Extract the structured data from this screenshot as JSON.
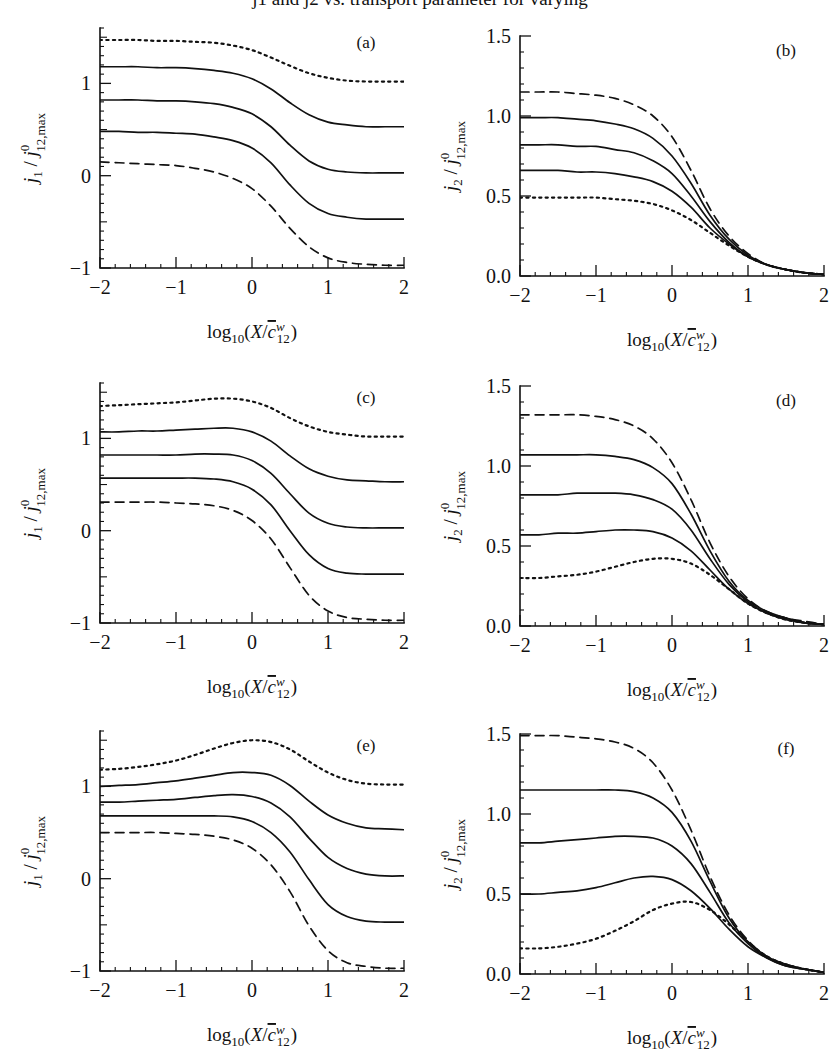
{
  "figure": {
    "background": "#ffffff",
    "ink": "#111111",
    "cropped_header": "j1 and j2 vs. transport parameter for varying",
    "panel_order": [
      "a",
      "b",
      "c",
      "d",
      "e",
      "f"
    ]
  },
  "axis_labels": {
    "x": {
      "parts": {
        "log": "log",
        "logsub": "10",
        "open": "(",
        "X": "X",
        "slash": "/",
        "c": "c",
        "csup": "w",
        "csub": "12",
        "close": ")"
      },
      "plain": "log10(X/c̄w12)"
    },
    "y1": {
      "parts": {
        "j": "j",
        "jsub": "1",
        "slash": "/",
        "j2": "j",
        "j2sup": "0",
        "j2sub": "12,max"
      },
      "plain": "j1 / j012,max"
    },
    "y2": {
      "parts": {
        "j": "j",
        "jsub": "2",
        "slash": "/",
        "j2": "j",
        "j2sup": "0",
        "j2sub": "12,max"
      },
      "plain": "j2 / j012,max"
    }
  },
  "chart_data": [
    {
      "id": "a",
      "type": "line",
      "title": "(a)",
      "xlabel": "log10(X/c̄w12)",
      "ylabel": "j1 / j012,max",
      "xlim": [
        -2,
        2
      ],
      "ylim": [
        -1,
        1.6
      ],
      "grid": false,
      "legend": "none",
      "xticks": [
        -2,
        -1,
        0,
        1,
        2
      ],
      "xticklabels": [
        "-2",
        "-1",
        "0",
        "1",
        "2"
      ],
      "yticks": [
        -1,
        0,
        1
      ],
      "yticklabels": [
        "-1",
        "0",
        "1"
      ],
      "y_minor_step": 0.1,
      "x_minor_step": 0.2,
      "x": [
        -2,
        -1.75,
        -1.5,
        -1.25,
        -1,
        -0.75,
        -0.5,
        -0.25,
        0,
        0.25,
        0.5,
        0.75,
        1,
        1.25,
        1.5,
        1.75,
        2
      ],
      "series": [
        {
          "name": "dotted-top",
          "style": "dotted",
          "values": [
            1.47,
            1.47,
            1.47,
            1.46,
            1.46,
            1.45,
            1.44,
            1.41,
            1.36,
            1.28,
            1.19,
            1.11,
            1.06,
            1.03,
            1.02,
            1.02,
            1.02
          ]
        },
        {
          "name": "solid-1",
          "style": "solid",
          "values": [
            1.18,
            1.18,
            1.18,
            1.17,
            1.17,
            1.16,
            1.14,
            1.11,
            1.05,
            0.94,
            0.79,
            0.66,
            0.58,
            0.55,
            0.53,
            0.53,
            0.53
          ]
        },
        {
          "name": "solid-2",
          "style": "solid",
          "values": [
            0.82,
            0.82,
            0.82,
            0.81,
            0.81,
            0.8,
            0.78,
            0.74,
            0.67,
            0.53,
            0.33,
            0.16,
            0.07,
            0.04,
            0.03,
            0.03,
            0.03
          ]
        },
        {
          "name": "solid-3",
          "style": "solid",
          "values": [
            0.48,
            0.48,
            0.47,
            0.47,
            0.46,
            0.45,
            0.42,
            0.38,
            0.3,
            0.14,
            -0.1,
            -0.3,
            -0.41,
            -0.45,
            -0.47,
            -0.47,
            -0.47
          ]
        },
        {
          "name": "dashed-bottom",
          "style": "dashed",
          "values": [
            0.15,
            0.14,
            0.13,
            0.12,
            0.11,
            0.08,
            0.04,
            -0.03,
            -0.14,
            -0.33,
            -0.57,
            -0.77,
            -0.89,
            -0.94,
            -0.96,
            -0.97,
            -0.97
          ]
        }
      ]
    },
    {
      "id": "b",
      "type": "line",
      "title": "(b)",
      "xlabel": "log10(X/c̄w12)",
      "ylabel": "j2 / j012,max",
      "xlim": [
        -2,
        2
      ],
      "ylim": [
        0,
        1.5
      ],
      "grid": false,
      "legend": "none",
      "xticks": [
        -2,
        -1,
        0,
        1,
        2
      ],
      "xticklabels": [
        "-2",
        "-1",
        "0",
        "1",
        "2"
      ],
      "yticks": [
        0,
        0.5,
        1.0,
        1.5
      ],
      "yticklabels": [
        "0.0",
        "0.5",
        "1.0",
        "1.5"
      ],
      "y_minor_step": 0.1,
      "x_minor_step": 0.2,
      "x": [
        -2,
        -1.75,
        -1.5,
        -1.25,
        -1,
        -0.75,
        -0.5,
        -0.25,
        0,
        0.25,
        0.5,
        0.75,
        1,
        1.25,
        1.5,
        1.75,
        2
      ],
      "series": [
        {
          "name": "dashed-top",
          "style": "dashed",
          "values": [
            1.15,
            1.15,
            1.15,
            1.14,
            1.13,
            1.11,
            1.07,
            1.0,
            0.87,
            0.66,
            0.42,
            0.25,
            0.14,
            0.07,
            0.04,
            0.02,
            0.01
          ]
        },
        {
          "name": "solid-1",
          "style": "solid",
          "values": [
            0.99,
            0.99,
            0.99,
            0.98,
            0.97,
            0.95,
            0.92,
            0.86,
            0.75,
            0.58,
            0.38,
            0.23,
            0.13,
            0.07,
            0.04,
            0.02,
            0.01
          ]
        },
        {
          "name": "solid-2",
          "style": "solid",
          "values": [
            0.82,
            0.82,
            0.82,
            0.81,
            0.81,
            0.79,
            0.77,
            0.72,
            0.64,
            0.5,
            0.34,
            0.21,
            0.12,
            0.07,
            0.04,
            0.02,
            0.01
          ]
        },
        {
          "name": "solid-3",
          "style": "solid",
          "values": [
            0.66,
            0.66,
            0.66,
            0.65,
            0.65,
            0.64,
            0.62,
            0.59,
            0.53,
            0.43,
            0.3,
            0.2,
            0.12,
            0.07,
            0.04,
            0.02,
            0.01
          ]
        },
        {
          "name": "dotted-bottom",
          "style": "dotted",
          "values": [
            0.49,
            0.49,
            0.49,
            0.49,
            0.49,
            0.48,
            0.47,
            0.45,
            0.41,
            0.35,
            0.27,
            0.19,
            0.12,
            0.07,
            0.04,
            0.02,
            0.01
          ]
        }
      ]
    },
    {
      "id": "c",
      "type": "line",
      "title": "(c)",
      "xlabel": "log10(X/c̄w12)",
      "ylabel": "j1 / j012,max",
      "xlim": [
        -2,
        2
      ],
      "ylim": [
        -1,
        1.6
      ],
      "grid": false,
      "legend": "none",
      "xticks": [
        -2,
        -1,
        0,
        1,
        2
      ],
      "xticklabels": [
        "-2",
        "-1",
        "0",
        "1",
        "2"
      ],
      "yticks": [
        -1,
        0,
        1
      ],
      "yticklabels": [
        "-1",
        "0",
        "1"
      ],
      "y_minor_step": 0.1,
      "x_minor_step": 0.2,
      "x": [
        -2,
        -1.75,
        -1.5,
        -1.25,
        -1,
        -0.75,
        -0.5,
        -0.25,
        0,
        0.25,
        0.5,
        0.75,
        1,
        1.25,
        1.5,
        1.75,
        2
      ],
      "series": [
        {
          "name": "dotted-top",
          "style": "dotted",
          "values": [
            1.35,
            1.36,
            1.37,
            1.38,
            1.39,
            1.41,
            1.43,
            1.43,
            1.4,
            1.33,
            1.22,
            1.13,
            1.07,
            1.04,
            1.02,
            1.02,
            1.02
          ]
        },
        {
          "name": "solid-1",
          "style": "solid",
          "values": [
            1.07,
            1.07,
            1.08,
            1.08,
            1.09,
            1.1,
            1.11,
            1.11,
            1.07,
            0.97,
            0.81,
            0.67,
            0.59,
            0.55,
            0.54,
            0.53,
            0.53
          ]
        },
        {
          "name": "solid-2",
          "style": "solid",
          "values": [
            0.82,
            0.82,
            0.82,
            0.82,
            0.82,
            0.83,
            0.83,
            0.82,
            0.76,
            0.62,
            0.4,
            0.19,
            0.08,
            0.04,
            0.03,
            0.03,
            0.03
          ]
        },
        {
          "name": "solid-3",
          "style": "solid",
          "values": [
            0.57,
            0.57,
            0.57,
            0.57,
            0.57,
            0.57,
            0.56,
            0.53,
            0.45,
            0.28,
            0.0,
            -0.26,
            -0.41,
            -0.46,
            -0.47,
            -0.47,
            -0.47
          ]
        },
        {
          "name": "dashed-bottom",
          "style": "dashed",
          "values": [
            0.31,
            0.31,
            0.31,
            0.31,
            0.3,
            0.29,
            0.27,
            0.22,
            0.11,
            -0.09,
            -0.4,
            -0.7,
            -0.87,
            -0.94,
            -0.96,
            -0.97,
            -0.97
          ]
        }
      ]
    },
    {
      "id": "d",
      "type": "line",
      "title": "(d)",
      "xlabel": "log10(X/c̄w12)",
      "ylabel": "j2 / j012,max",
      "xlim": [
        -2,
        2
      ],
      "ylim": [
        0,
        1.5
      ],
      "grid": false,
      "legend": "none",
      "xticks": [
        -2,
        -1,
        0,
        1,
        2
      ],
      "xticklabels": [
        "-2",
        "-1",
        "0",
        "1",
        "2"
      ],
      "yticks": [
        0,
        0.5,
        1.0,
        1.5
      ],
      "yticklabels": [
        "0.0",
        "0.5",
        "1.0",
        "1.5"
      ],
      "y_minor_step": 0.1,
      "x_minor_step": 0.2,
      "x": [
        -2,
        -1.75,
        -1.5,
        -1.25,
        -1,
        -0.75,
        -0.5,
        -0.25,
        0,
        0.25,
        0.5,
        0.75,
        1,
        1.25,
        1.5,
        1.75,
        2
      ],
      "series": [
        {
          "name": "dashed-top",
          "style": "dashed",
          "values": [
            1.32,
            1.32,
            1.32,
            1.32,
            1.31,
            1.29,
            1.25,
            1.17,
            1.02,
            0.79,
            0.52,
            0.31,
            0.17,
            0.09,
            0.05,
            0.03,
            0.01
          ]
        },
        {
          "name": "solid-1",
          "style": "solid",
          "values": [
            1.07,
            1.07,
            1.07,
            1.07,
            1.07,
            1.06,
            1.04,
            0.99,
            0.89,
            0.7,
            0.47,
            0.28,
            0.16,
            0.09,
            0.05,
            0.02,
            0.01
          ]
        },
        {
          "name": "solid-2",
          "style": "solid",
          "values": [
            0.82,
            0.82,
            0.82,
            0.83,
            0.83,
            0.83,
            0.82,
            0.79,
            0.73,
            0.6,
            0.42,
            0.26,
            0.15,
            0.08,
            0.05,
            0.02,
            0.01
          ]
        },
        {
          "name": "solid-3",
          "style": "solid",
          "values": [
            0.57,
            0.57,
            0.58,
            0.58,
            0.59,
            0.6,
            0.6,
            0.59,
            0.55,
            0.47,
            0.35,
            0.23,
            0.14,
            0.08,
            0.04,
            0.02,
            0.01
          ]
        },
        {
          "name": "dotted-bottom",
          "style": "dotted",
          "values": [
            0.3,
            0.3,
            0.31,
            0.32,
            0.34,
            0.37,
            0.4,
            0.42,
            0.42,
            0.39,
            0.32,
            0.23,
            0.14,
            0.08,
            0.04,
            0.02,
            0.01
          ]
        }
      ]
    },
    {
      "id": "e",
      "type": "line",
      "title": "(e)",
      "xlabel": "log10(X/c̄w12)",
      "ylabel": "j1 / j012,max",
      "xlim": [
        -2,
        2
      ],
      "ylim": [
        -1,
        1.6
      ],
      "grid": false,
      "legend": "none",
      "xticks": [
        -2,
        -1,
        0,
        1,
        2
      ],
      "xticklabels": [
        "-2",
        "-1",
        "0",
        "1",
        "2"
      ],
      "yticks": [
        -1,
        0,
        1
      ],
      "yticklabels": [
        "-1",
        "0",
        "1"
      ],
      "y_minor_step": 0.1,
      "x_minor_step": 0.2,
      "x": [
        -2,
        -1.75,
        -1.5,
        -1.25,
        -1,
        -0.75,
        -0.5,
        -0.25,
        0,
        0.25,
        0.5,
        0.75,
        1,
        1.25,
        1.5,
        1.75,
        2
      ],
      "series": [
        {
          "name": "dotted-top",
          "style": "dotted",
          "values": [
            1.18,
            1.19,
            1.21,
            1.24,
            1.28,
            1.34,
            1.41,
            1.47,
            1.5,
            1.48,
            1.4,
            1.27,
            1.15,
            1.07,
            1.03,
            1.02,
            1.02
          ]
        },
        {
          "name": "solid-1",
          "style": "solid",
          "values": [
            1.0,
            1.01,
            1.02,
            1.04,
            1.06,
            1.09,
            1.12,
            1.15,
            1.15,
            1.12,
            1.01,
            0.84,
            0.69,
            0.6,
            0.55,
            0.54,
            0.53
          ]
        },
        {
          "name": "solid-2",
          "style": "solid",
          "values": [
            0.83,
            0.83,
            0.84,
            0.85,
            0.86,
            0.88,
            0.9,
            0.91,
            0.89,
            0.82,
            0.67,
            0.44,
            0.23,
            0.11,
            0.05,
            0.03,
            0.03
          ]
        },
        {
          "name": "solid-3",
          "style": "solid",
          "values": [
            0.68,
            0.68,
            0.68,
            0.68,
            0.68,
            0.68,
            0.68,
            0.67,
            0.62,
            0.5,
            0.29,
            -0.01,
            -0.28,
            -0.41,
            -0.46,
            -0.47,
            -0.47
          ]
        },
        {
          "name": "dashed-bottom",
          "style": "dashed",
          "values": [
            0.5,
            0.5,
            0.5,
            0.5,
            0.49,
            0.48,
            0.46,
            0.42,
            0.33,
            0.15,
            -0.14,
            -0.51,
            -0.78,
            -0.91,
            -0.95,
            -0.97,
            -0.97
          ]
        }
      ]
    },
    {
      "id": "f",
      "type": "line",
      "title": "(f)",
      "xlabel": "log10(X/c̄w12)",
      "ylabel": "j2 / j012,max",
      "xlim": [
        -2,
        2
      ],
      "ylim": [
        0,
        1.5
      ],
      "grid": false,
      "legend": "none",
      "xticks": [
        -2,
        -1,
        0,
        1,
        2
      ],
      "xticklabels": [
        "-2",
        "-1",
        "0",
        "1",
        "2"
      ],
      "yticks": [
        0,
        0.5,
        1.0,
        1.5
      ],
      "yticklabels": [
        "0.0",
        "0.5",
        "1.0",
        "1.5"
      ],
      "y_minor_step": 0.1,
      "x_minor_step": 0.2,
      "x": [
        -2,
        -1.75,
        -1.5,
        -1.25,
        -1,
        -0.75,
        -0.5,
        -0.25,
        0,
        0.25,
        0.5,
        0.75,
        1,
        1.25,
        1.5,
        1.75,
        2
      ],
      "series": [
        {
          "name": "dashed-top",
          "style": "dashed",
          "values": [
            1.49,
            1.49,
            1.49,
            1.48,
            1.47,
            1.45,
            1.41,
            1.32,
            1.15,
            0.9,
            0.61,
            0.37,
            0.21,
            0.11,
            0.06,
            0.03,
            0.01
          ]
        },
        {
          "name": "solid-1",
          "style": "solid",
          "values": [
            1.15,
            1.15,
            1.15,
            1.15,
            1.15,
            1.15,
            1.14,
            1.1,
            1.01,
            0.83,
            0.58,
            0.35,
            0.2,
            0.11,
            0.06,
            0.03,
            0.01
          ]
        },
        {
          "name": "solid-2",
          "style": "solid",
          "values": [
            0.82,
            0.82,
            0.83,
            0.84,
            0.85,
            0.86,
            0.86,
            0.85,
            0.8,
            0.69,
            0.51,
            0.32,
            0.19,
            0.1,
            0.05,
            0.03,
            0.01
          ]
        },
        {
          "name": "solid-3",
          "style": "solid",
          "values": [
            0.5,
            0.5,
            0.51,
            0.52,
            0.54,
            0.57,
            0.6,
            0.61,
            0.59,
            0.52,
            0.41,
            0.28,
            0.17,
            0.1,
            0.05,
            0.03,
            0.01
          ]
        },
        {
          "name": "dotted-bottom",
          "style": "dotted",
          "values": [
            0.16,
            0.16,
            0.17,
            0.19,
            0.22,
            0.27,
            0.33,
            0.4,
            0.44,
            0.45,
            0.4,
            0.31,
            0.2,
            0.11,
            0.06,
            0.03,
            0.01
          ]
        }
      ]
    }
  ]
}
